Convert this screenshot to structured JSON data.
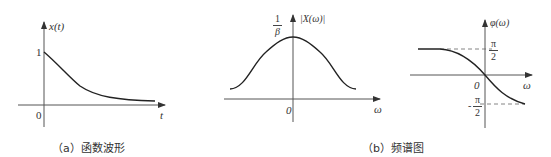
{
  "figure_a": {
    "caption": "（a）函数波形",
    "y_label": "x(t)",
    "x_label": "t",
    "origin_label": "0",
    "y_tick_label": "1",
    "curve": "exponential decay from 1 at t=0 toward 0"
  },
  "figure_b": {
    "caption": "（b）频谱图",
    "magnitude": {
      "y_label": "|X(ω)|",
      "x_label": "ω",
      "origin_label": "0",
      "peak_label_num": "1",
      "peak_label_den": "β",
      "curve": "bell-shaped symmetric curve with peak 1/β at ω=0"
    },
    "phase": {
      "y_label": "φ(ω)",
      "x_label": "ω",
      "origin_label": "0",
      "upper_label_num": "π",
      "upper_label_den": "2",
      "lower_label_sign": "-",
      "lower_label_num": "π",
      "lower_label_den": "2",
      "curve": "decreasing from π/2 to -π/2 passing through origin"
    }
  }
}
